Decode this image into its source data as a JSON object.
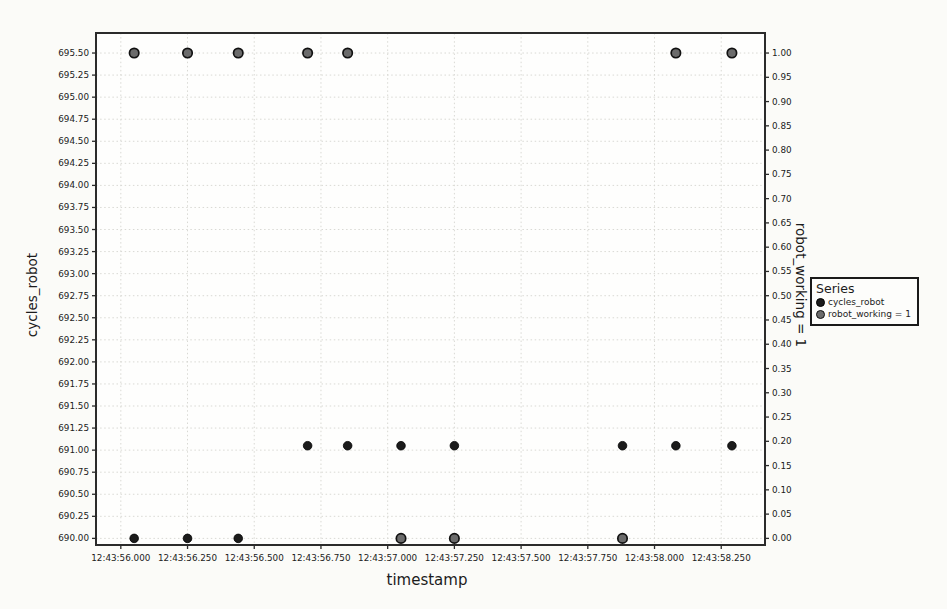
{
  "chart_data": {
    "type": "scatter",
    "title": "",
    "xlabel": "timestamp",
    "ylabel_left": "cycles_robot",
    "ylabel_right": "robot_working = 1",
    "grid": true,
    "colors": {
      "cycles_robot_fill": "#1b1b1b",
      "cycles_robot_stroke": "#000000",
      "robot_working_fill": "#6b6b6b",
      "robot_working_stroke": "#111111",
      "frame": "#2b2b2b",
      "gridline": "#d9d9d4"
    },
    "legend": {
      "title": "Series",
      "position": "right-outside",
      "entries": [
        {
          "label": "cycles_robot",
          "marker": "dot",
          "fill": "#1b1b1b",
          "stroke": "#000000"
        },
        {
          "label": "robot_working = 1",
          "marker": "dot",
          "fill": "#6b6b6b",
          "stroke": "#111111"
        }
      ]
    },
    "x_axis": {
      "label": "timestamp",
      "tick_labels": [
        "12:43:56.000",
        "12:43:56.250",
        "12:43:56.500",
        "12:43:56.750",
        "12:43:57.000",
        "12:43:57.250",
        "12:43:57.500",
        "12:43:57.750",
        "12:43:58.000",
        "12:43:58.250"
      ],
      "tick_seconds": [
        56.0,
        56.25,
        56.5,
        56.75,
        57.0,
        57.25,
        57.5,
        57.75,
        58.0,
        58.25
      ],
      "range_seconds": [
        55.907,
        58.414
      ]
    },
    "y_axis_left": {
      "label": "cycles_robot",
      "tick_labels": [
        "695.50",
        "695.25",
        "695.00",
        "694.75",
        "694.50",
        "694.25",
        "694.00",
        "693.75",
        "693.50",
        "693.25",
        "693.00",
        "692.75",
        "692.50",
        "692.25",
        "692.00",
        "691.75",
        "691.50",
        "691.25",
        "691.00",
        "690.75",
        "690.50",
        "690.25",
        "690.00"
      ],
      "tick_values": [
        695.5,
        695.25,
        695.0,
        694.75,
        694.5,
        694.25,
        694.0,
        693.75,
        693.5,
        693.25,
        693.0,
        692.75,
        692.5,
        692.25,
        692.0,
        691.75,
        691.5,
        691.25,
        691.0,
        690.75,
        690.5,
        690.25,
        690.0
      ],
      "range": [
        689.925,
        695.727
      ]
    },
    "y_axis_right": {
      "label": "robot_working = 1",
      "tick_labels": [
        "1.00",
        "0.95",
        "0.90",
        "0.85",
        "0.80",
        "0.75",
        "0.70",
        "0.65",
        "0.60",
        "0.55",
        "0.50",
        "0.45",
        "0.40",
        "0.35",
        "0.30",
        "0.25",
        "0.20",
        "0.15",
        "0.10",
        "0.05",
        "0.00"
      ],
      "tick_values": [
        1.0,
        0.95,
        0.9,
        0.85,
        0.8,
        0.75,
        0.7,
        0.65,
        0.6,
        0.55,
        0.5,
        0.45,
        0.4,
        0.35,
        0.3,
        0.25,
        0.2,
        0.15,
        0.1,
        0.05,
        0.0
      ],
      "scale": {
        "left_equiv_base": 690.0,
        "left_equiv_span": 5.5
      }
    },
    "series": [
      {
        "name": "cycles_robot",
        "axis": "left",
        "x_seconds": [
          56.05,
          56.25,
          56.44,
          56.7,
          56.85,
          57.05,
          57.25,
          57.88,
          58.08,
          58.29
        ],
        "y": [
          690.0,
          690.0,
          690.0,
          691.05,
          691.05,
          691.05,
          691.05,
          691.05,
          691.05,
          691.05
        ]
      },
      {
        "name": "robot_working = 1",
        "axis": "right",
        "x_seconds": [
          56.05,
          56.25,
          56.44,
          56.7,
          56.85,
          57.05,
          57.25,
          57.88,
          58.08,
          58.29
        ],
        "y": [
          1,
          1,
          1,
          1,
          1,
          0,
          0,
          0,
          1,
          1
        ]
      }
    ]
  }
}
